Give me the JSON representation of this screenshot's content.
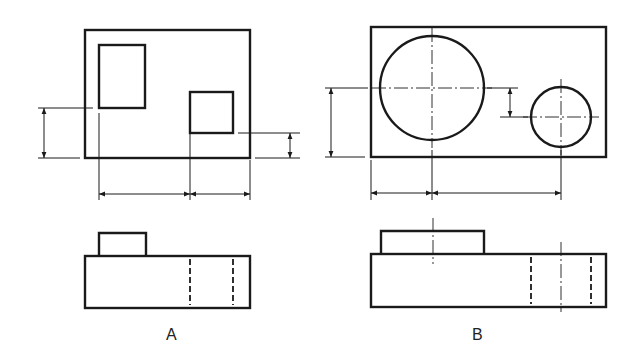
{
  "figure": {
    "stroke": "#1a1a1a",
    "background": "#ffffff",
    "views": [
      {
        "id": "A",
        "label": "A",
        "label_pos": [
          172,
          336
        ],
        "top_view": {
          "outline": [
            85,
            30,
            250,
            158
          ],
          "features": [
            {
              "type": "rect",
              "x": 99,
              "y": 45,
              "w": 46,
              "h": 63
            },
            {
              "type": "rect",
              "x": 190,
              "y": 92,
              "w": 43,
              "h": 41
            }
          ]
        },
        "front_view": {
          "body": [
            85,
            256,
            250,
            308
          ],
          "boss": [
            99,
            233,
            146,
            256
          ],
          "hidden_lines_x": [
            190,
            233
          ]
        },
        "dimensions": [
          {
            "orient": "v",
            "x": 44,
            "y1": 108,
            "y2": 158,
            "ext": [
              [
                38,
                108,
                93,
                108
              ],
              [
                38,
                158,
                80,
                158
              ]
            ]
          },
          {
            "orient": "v",
            "x": 290,
            "y1": 133,
            "y2": 158,
            "ext": [
              [
                238,
                133,
                300,
                133
              ],
              [
                255,
                158,
                300,
                158
              ]
            ]
          },
          {
            "orient": "h",
            "y": 194,
            "x1": 99,
            "x2": 190,
            "ext": [
              [
                99,
                113,
                99,
                200
              ],
              [
                190,
                133,
                190,
                200
              ]
            ]
          },
          {
            "orient": "h",
            "y": 194,
            "x1": 190,
            "x2": 250,
            "ext": [
              [
                250,
                160,
                250,
                200
              ]
            ]
          }
        ]
      },
      {
        "id": "B",
        "label": "B",
        "label_pos": [
          478,
          336
        ],
        "top_view": {
          "outline": [
            371,
            27,
            606,
            157
          ],
          "features": [
            {
              "type": "circle",
              "cx": 432,
              "cy": 88,
              "r": 52
            },
            {
              "type": "circle",
              "cx": 561,
              "cy": 117,
              "r": 30
            }
          ]
        },
        "front_view": {
          "body": [
            371,
            254,
            606,
            307
          ],
          "boss": [
            381,
            231,
            484,
            254
          ],
          "hidden_lines_x": [
            531,
            591
          ],
          "center_lines_x": [
            [
              433,
              218,
              264
            ],
            [
              561,
              242,
              312
            ]
          ]
        },
        "dimensions": [
          {
            "orient": "v",
            "x": 331,
            "y1": 88,
            "y2": 157,
            "ext": [
              [
                325,
                88,
                368,
                88
              ],
              [
                325,
                157,
                365,
                157
              ]
            ]
          },
          {
            "orient": "v",
            "x": 510,
            "y1": 88,
            "y2": 117,
            "ext": [
              [
                487,
                88,
                518,
                88
              ],
              [
                500,
                117,
                528,
                117
              ]
            ]
          },
          {
            "orient": "h",
            "y": 193,
            "x1": 371,
            "x2": 432,
            "ext": [
              [
                371,
                160,
                371,
                200
              ]
            ]
          },
          {
            "orient": "h",
            "y": 193,
            "x1": 432,
            "x2": 561,
            "ext": [
              [
                432,
                150,
                432,
                200
              ],
              [
                561,
                150,
                561,
                200
              ]
            ]
          }
        ]
      }
    ]
  }
}
